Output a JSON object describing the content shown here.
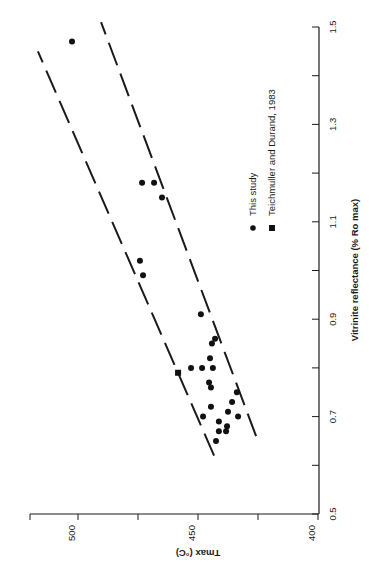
{
  "chart_data": {
    "type": "scatter",
    "title": "",
    "xlabel": "Vitrinite reflectance (% Ro max)",
    "ylabel": "Tmax (°C)",
    "xlim": [
      0.5,
      1.5
    ],
    "ylim": [
      400,
      520
    ],
    "x_ticks": [
      "0.5",
      "0.7",
      "0.9",
      "1.1",
      "1.3",
      "1.5"
    ],
    "x_tick_values": [
      0.5,
      0.6,
      0.7,
      0.8,
      0.9,
      1.0,
      1.1,
      1.2,
      1.3,
      1.4,
      1.5
    ],
    "y_ticks": [
      "400",
      "450",
      "500"
    ],
    "y_tick_values": [
      400,
      425,
      450,
      475,
      500,
      520
    ],
    "grid": false,
    "rotation": "plot rotated 90° counter-clockwise on page",
    "legend": [
      {
        "label": "This study",
        "marker": "circle"
      },
      {
        "label": "Teichmuller and Durand, 1983",
        "marker": "square"
      }
    ],
    "series": [
      {
        "name": "This study",
        "marker": "circle",
        "points": [
          {
            "x": 1.47,
            "y": 502.5
          },
          {
            "x": 1.18,
            "y": 473.3
          },
          {
            "x": 1.18,
            "y": 468.3
          },
          {
            "x": 1.15,
            "y": 465.0
          },
          {
            "x": 1.02,
            "y": 474.2
          },
          {
            "x": 0.99,
            "y": 472.9
          },
          {
            "x": 0.91,
            "y": 448.8
          },
          {
            "x": 0.85,
            "y": 444.2
          },
          {
            "x": 0.86,
            "y": 442.9
          },
          {
            "x": 0.82,
            "y": 445.0
          },
          {
            "x": 0.8,
            "y": 452.9
          },
          {
            "x": 0.8,
            "y": 448.3
          },
          {
            "x": 0.8,
            "y": 443.8
          },
          {
            "x": 0.77,
            "y": 445.4
          },
          {
            "x": 0.76,
            "y": 444.6
          },
          {
            "x": 0.75,
            "y": 433.8
          },
          {
            "x": 0.73,
            "y": 435.8
          },
          {
            "x": 0.72,
            "y": 444.6
          },
          {
            "x": 0.71,
            "y": 437.5
          },
          {
            "x": 0.7,
            "y": 447.9
          },
          {
            "x": 0.7,
            "y": 433.3
          },
          {
            "x": 0.69,
            "y": 441.3
          },
          {
            "x": 0.68,
            "y": 437.9
          },
          {
            "x": 0.67,
            "y": 441.3
          },
          {
            "x": 0.67,
            "y": 438.3
          },
          {
            "x": 0.65,
            "y": 442.5
          }
        ]
      },
      {
        "name": "Teichmuller and Durand, 1983",
        "marker": "square",
        "points": [
          {
            "x": 0.79,
            "y": 458.3
          }
        ]
      }
    ],
    "reference_lines": [
      {
        "style": "dashed",
        "from": {
          "x": 0.62,
          "y": 443.3
        },
        "to": {
          "x": 1.45,
          "y": 516.7
        }
      },
      {
        "style": "dashed",
        "from": {
          "x": 0.66,
          "y": 425.8
        },
        "to": {
          "x": 1.51,
          "y": 490.4
        }
      }
    ]
  }
}
